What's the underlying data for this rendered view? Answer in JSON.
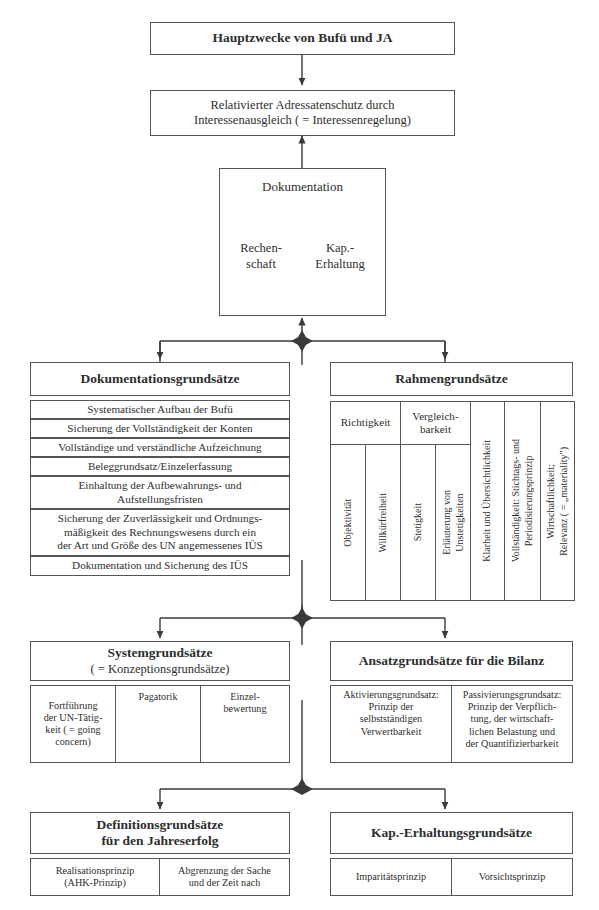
{
  "diagram": {
    "title": "Hauptzwecke von Bufü und JA",
    "top_box": {
      "label": "Hauptzwecke von Bufü und JA"
    },
    "second_box": {
      "line1": "Relativierter Adressatenschutz durch",
      "line2": "Interessenausgleich ( = Interessenregelung)"
    },
    "documentation_box": {
      "center": "Dokumentation",
      "left_line1": "Rechen-",
      "left_line2": "schaft",
      "right_line1": "Kap.-",
      "right_line2": "Erhaltung"
    },
    "sections": [
      {
        "id": "dokumentationsgrundsaetze",
        "header": "Dokumentationsgrundsätze",
        "subheader": "",
        "items": [
          "Systematischer Aufbau der Bufü",
          "Sicherung der Vollständigkeit der Konten",
          "Vollständige und verständliche Aufzeichnung",
          "Beleggrundsatz/Einzelerfassung",
          "Einhaltung der Aufbewahrungs- und\nAufstellungsfristen",
          "Sicherung der Zuverlässigkeit und Ordnungs-\nmäßigkeit des Rechnungswesens durch ein\nder Art und Größe des UN angemessenes IÜS",
          "Dokumentation und Sicherung des IÜS"
        ]
      },
      {
        "id": "rahmengrundsaetze",
        "header": "Rahmengrundsätze",
        "group_headers": [
          {
            "label": "Richtigkeit",
            "span": 2
          },
          {
            "label": "Vergleich-\nbarkeit",
            "span": 2
          }
        ],
        "columns": [
          "Objektivität",
          "Willkürfreiheit",
          "Stetigkeit",
          "Erläuterung von\nUnstetigkeiten",
          "Klarheit und Übersichtlichkeit",
          "Vollständigkeit: Stichtags- und\nPeriodisierungsprinzip",
          "Wirtschaftlichkeit;\nRelevanz ( = „materiality\")"
        ]
      },
      {
        "id": "systemgrundsaetze",
        "header": "Systemgrundsätze",
        "subheader": "( = Konzeptionsgrundsätze)",
        "items": [
          "Fortführung\nder UN-Tätig-\nkeit ( = going\nconcern)",
          "Pagatorik",
          "Einzel-\nbewertung"
        ]
      },
      {
        "id": "ansatzgrundsaetze",
        "header": "Ansatzgrundsätze für die Bilanz",
        "subheader": "",
        "items": [
          "Aktivierungsgrundsatz:\nPrinzip der\nselbstständigen\nVerwertbarkeit",
          "Passivierungsgrundsatz:\nPrinzip der Verpflich-\ntung, der wirtschaft-\nlichen Belastung und\nder Quantifizierbarkeit"
        ]
      },
      {
        "id": "definitionsgrundsaetze",
        "header": "Definitionsgrundsätze",
        "subheader": "für den Jahreserfolg",
        "items": [
          "Realisationsprinzip\n(AHK-Prinzip)",
          "Abgrenzung der Sache\nund der Zeit nach"
        ]
      },
      {
        "id": "kap-erhaltungsgrundsaetze",
        "header": "Kap.-Erhaltungsgrundsätze",
        "subheader": "",
        "items": [
          "Imparitätsprinzip",
          "Vorsichtsprinzip"
        ]
      }
    ],
    "colors": {
      "stroke": "#555555",
      "text": "#2e2e2e",
      "background": "#ffffff"
    }
  }
}
